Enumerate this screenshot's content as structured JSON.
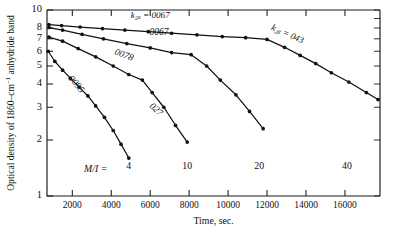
{
  "chart_data": {
    "type": "line",
    "title": "",
    "xlabel": "Time, sec.",
    "ylabel": "Optical density of 1860-cm⁻¹ anhydride band",
    "ylabel_parts": {
      "prefix": "Optical density of 1860–cm",
      "exponent": "–1",
      "suffix": "anhydride band"
    },
    "xlim": [
      700,
      17800
    ],
    "ylim": [
      1,
      10
    ],
    "yscale": "log",
    "xscale": "linear",
    "grid": false,
    "legend": "inline-curve-labels",
    "xticks": [
      2000,
      4000,
      6000,
      8000,
      10000,
      12000,
      14000,
      16000
    ],
    "xtick_labels": [
      "2000",
      "4000",
      "6000",
      "8000",
      "10000",
      "12000",
      "14000",
      "16000"
    ],
    "yticks": [
      1,
      2,
      3,
      4,
      5,
      6,
      7,
      8,
      10
    ],
    "ytick_labels": [
      "1",
      "2",
      "3",
      "4",
      "5",
      "6",
      "7",
      "8",
      "10"
    ],
    "annotations": [
      {
        "name": "k2a-annotation",
        "text": "k₂ₐ = 0067",
        "x": 6000,
        "y": 9.1,
        "rotation": 0
      },
      {
        "name": "k2b-annotation",
        "text": "k₂ᵦ = 043",
        "x": 13000,
        "y": 7.2,
        "rotation": 24
      },
      {
        "name": "mi-annotation",
        "text": "M/I =",
        "x": 3200,
        "y": 1.35,
        "rotation": 0
      }
    ],
    "series": [
      {
        "name": "series-mi-40",
        "label": "0067",
        "label_position": {
          "x": 6450,
          "y": 7.35,
          "rotation": 0
        },
        "end_label": "40",
        "end_label_position": {
          "x": 16100,
          "y": 1.4
        },
        "points": [
          {
            "x": 800,
            "y": 8.35
          },
          {
            "x": 1450,
            "y": 8.25
          },
          {
            "x": 2400,
            "y": 8.1
          },
          {
            "x": 3550,
            "y": 7.95
          },
          {
            "x": 4700,
            "y": 7.8
          },
          {
            "x": 5900,
            "y": 7.65
          },
          {
            "x": 7100,
            "y": 7.5
          },
          {
            "x": 8400,
            "y": 7.35
          },
          {
            "x": 9700,
            "y": 7.2
          },
          {
            "x": 10900,
            "y": 7.1
          },
          {
            "x": 12000,
            "y": 6.95
          },
          {
            "x": 12900,
            "y": 6.3
          },
          {
            "x": 13700,
            "y": 5.7
          },
          {
            "x": 14500,
            "y": 5.15
          },
          {
            "x": 15300,
            "y": 4.6
          },
          {
            "x": 16200,
            "y": 4.1
          },
          {
            "x": 17100,
            "y": 3.6
          },
          {
            "x": 17700,
            "y": 3.3
          }
        ]
      },
      {
        "name": "series-mi-20",
        "label": "0078",
        "label_position": {
          "x": 4600,
          "y": 5.55,
          "rotation": 22
        },
        "end_label": "20",
        "end_label_position": {
          "x": 11600,
          "y": 1.4
        },
        "points": [
          {
            "x": 800,
            "y": 8.05
          },
          {
            "x": 1500,
            "y": 7.8
          },
          {
            "x": 2500,
            "y": 7.4
          },
          {
            "x": 3600,
            "y": 7.0
          },
          {
            "x": 4800,
            "y": 6.6
          },
          {
            "x": 6000,
            "y": 6.25
          },
          {
            "x": 7100,
            "y": 5.9
          },
          {
            "x": 8100,
            "y": 5.75
          },
          {
            "x": 8900,
            "y": 5.0
          },
          {
            "x": 9600,
            "y": 4.2
          },
          {
            "x": 10400,
            "y": 3.5
          },
          {
            "x": 11100,
            "y": 2.85
          },
          {
            "x": 11800,
            "y": 2.3
          }
        ]
      },
      {
        "name": "series-mi-10",
        "label": "027",
        "label_position": {
          "x": 6200,
          "y": 2.85,
          "rotation": 44
        },
        "end_label": "10",
        "end_label_position": {
          "x": 7900,
          "y": 1.4
        },
        "points": [
          {
            "x": 800,
            "y": 7.15
          },
          {
            "x": 1500,
            "y": 6.8
          },
          {
            "x": 2300,
            "y": 6.2
          },
          {
            "x": 3200,
            "y": 5.6
          },
          {
            "x": 4100,
            "y": 5.0
          },
          {
            "x": 4900,
            "y": 4.5
          },
          {
            "x": 5600,
            "y": 4.2
          },
          {
            "x": 6100,
            "y": 3.6
          },
          {
            "x": 6700,
            "y": 3.0
          },
          {
            "x": 7300,
            "y": 2.4
          },
          {
            "x": 7900,
            "y": 1.95
          }
        ]
      },
      {
        "name": "series-mi-4",
        "label": "0095",
        "label_position": {
          "x": 2100,
          "y": 3.9,
          "rotation": 50
        },
        "end_label": "4",
        "end_label_position": {
          "x": 4900,
          "y": 1.4
        },
        "points": [
          {
            "x": 760,
            "y": 6.0
          },
          {
            "x": 1100,
            "y": 5.3
          },
          {
            "x": 1500,
            "y": 4.75
          },
          {
            "x": 1900,
            "y": 4.3
          },
          {
            "x": 2350,
            "y": 3.85
          },
          {
            "x": 2800,
            "y": 3.45
          },
          {
            "x": 3200,
            "y": 3.05
          },
          {
            "x": 3650,
            "y": 2.65
          },
          {
            "x": 4100,
            "y": 2.25
          },
          {
            "x": 4500,
            "y": 1.9
          },
          {
            "x": 4900,
            "y": 1.6
          }
        ]
      },
      {
        "name": "series-upper-segment",
        "label": "",
        "label_position": {
          "x": 0,
          "y": 0,
          "rotation": 0
        },
        "end_label": "",
        "end_label_position": {
          "x": 0,
          "y": 0
        },
        "points": []
      }
    ]
  },
  "colors": {
    "ink": "#121212",
    "axis": "#1a1a1a",
    "background": "#ffffff"
  }
}
